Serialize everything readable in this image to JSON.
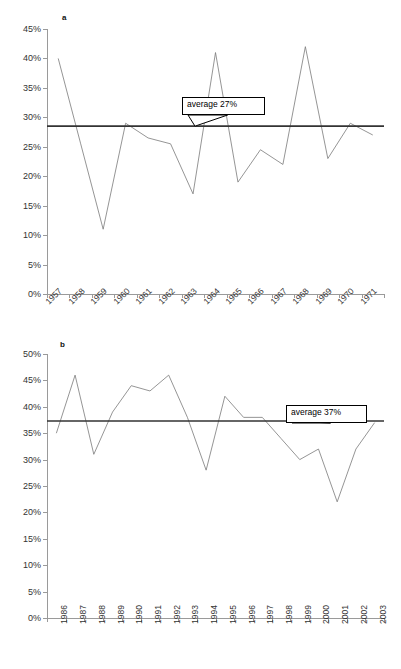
{
  "figure": {
    "panels": [
      {
        "key": "a",
        "label": "a",
        "chart_data": {
          "type": "line",
          "title": "",
          "xlabel": "",
          "ylabel": "",
          "grid": false,
          "legend": "none",
          "ylim": [
            0,
            45
          ],
          "ytick_labels": [
            "45%",
            "40%",
            "35%",
            "30%",
            "25%",
            "20%",
            "15%",
            "10%",
            "5%",
            "0%"
          ],
          "ytick_values": [
            45,
            40,
            35,
            30,
            25,
            20,
            15,
            10,
            5,
            0
          ],
          "categories": [
            "1957",
            "1958",
            "1959",
            "1960",
            "1961",
            "1962",
            "1963",
            "1964",
            "1965",
            "1966",
            "1967",
            "1968",
            "1969",
            "1970",
            "1971"
          ],
          "values": [
            40,
            25.5,
            11,
            29,
            26.5,
            25.5,
            17,
            41,
            19,
            24.5,
            22,
            42,
            23,
            29,
            27
          ],
          "series": [
            {
              "name": "annual value",
              "values": [
                40,
                25.5,
                11,
                29,
                26.5,
                25.5,
                17,
                41,
                19,
                24.5,
                22,
                42,
                23,
                29,
                27
              ]
            }
          ],
          "annotations": [
            {
              "text": "average 27%",
              "type": "callout",
              "points_to_value": 28.5
            }
          ],
          "reference_line": {
            "label": "average 27%",
            "value": 28.5,
            "color": "#333333"
          }
        }
      },
      {
        "key": "b",
        "label": "b",
        "chart_data": {
          "type": "line",
          "title": "",
          "xlabel": "",
          "ylabel": "",
          "grid": false,
          "legend": "none",
          "ylim": [
            0,
            50
          ],
          "ytick_labels": [
            "50%",
            "45%",
            "40%",
            "35%",
            "30%",
            "25%",
            "20%",
            "15%",
            "10%",
            "5%",
            "0%"
          ],
          "ytick_values": [
            50,
            45,
            40,
            35,
            30,
            25,
            20,
            15,
            10,
            5,
            0
          ],
          "categories": [
            "1986",
            "1987",
            "1988",
            "1989",
            "1990",
            "1991",
            "1992",
            "1993",
            "1994",
            "1995",
            "1996",
            "1997",
            "1998",
            "1999",
            "2000",
            "2001",
            "2002",
            "2003"
          ],
          "values": [
            35,
            46,
            31,
            39,
            44,
            43,
            46,
            38,
            28,
            42,
            38,
            38,
            34,
            30,
            32,
            22,
            32,
            37
          ],
          "series": [
            {
              "name": "annual value",
              "values": [
                35,
                46,
                31,
                39,
                44,
                43,
                46,
                38,
                28,
                42,
                38,
                38,
                34,
                30,
                32,
                22,
                32,
                37
              ]
            }
          ],
          "annotations": [
            {
              "text": "average 37%",
              "type": "callout",
              "points_to_value": 37.3
            }
          ],
          "reference_line": {
            "label": "average 37%",
            "value": 37.3,
            "color": "#333333"
          }
        }
      }
    ],
    "colors": {
      "series_line": "#7a7a7a",
      "average_line": "#333333",
      "axis": "#9a9a9a",
      "text": "#333333",
      "background": "#ffffff"
    }
  }
}
